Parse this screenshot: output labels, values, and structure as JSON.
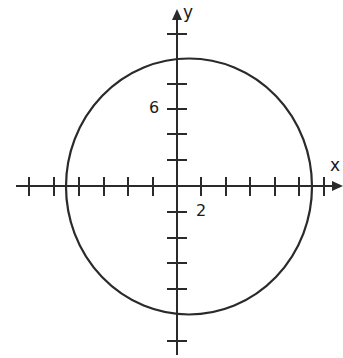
{
  "diagram": {
    "type": "coordinate-plane-circle",
    "axes": {
      "x_label": "x",
      "y_label": "y",
      "x_tick_step": 2,
      "y_tick_step": 2,
      "labeled_ticks": [
        {
          "axis": "x",
          "value": "2"
        },
        {
          "axis": "y",
          "value": "6"
        }
      ],
      "x_ticks_left": 6,
      "x_ticks_right": 6,
      "y_ticks_up": 4,
      "y_ticks_down": 6
    },
    "circle": {
      "center": [
        1,
        0
      ],
      "radius": 10,
      "stroke": "#2a2a2a"
    },
    "colors": {
      "ink": "#2a2a2a",
      "background": "#ffffff"
    }
  }
}
